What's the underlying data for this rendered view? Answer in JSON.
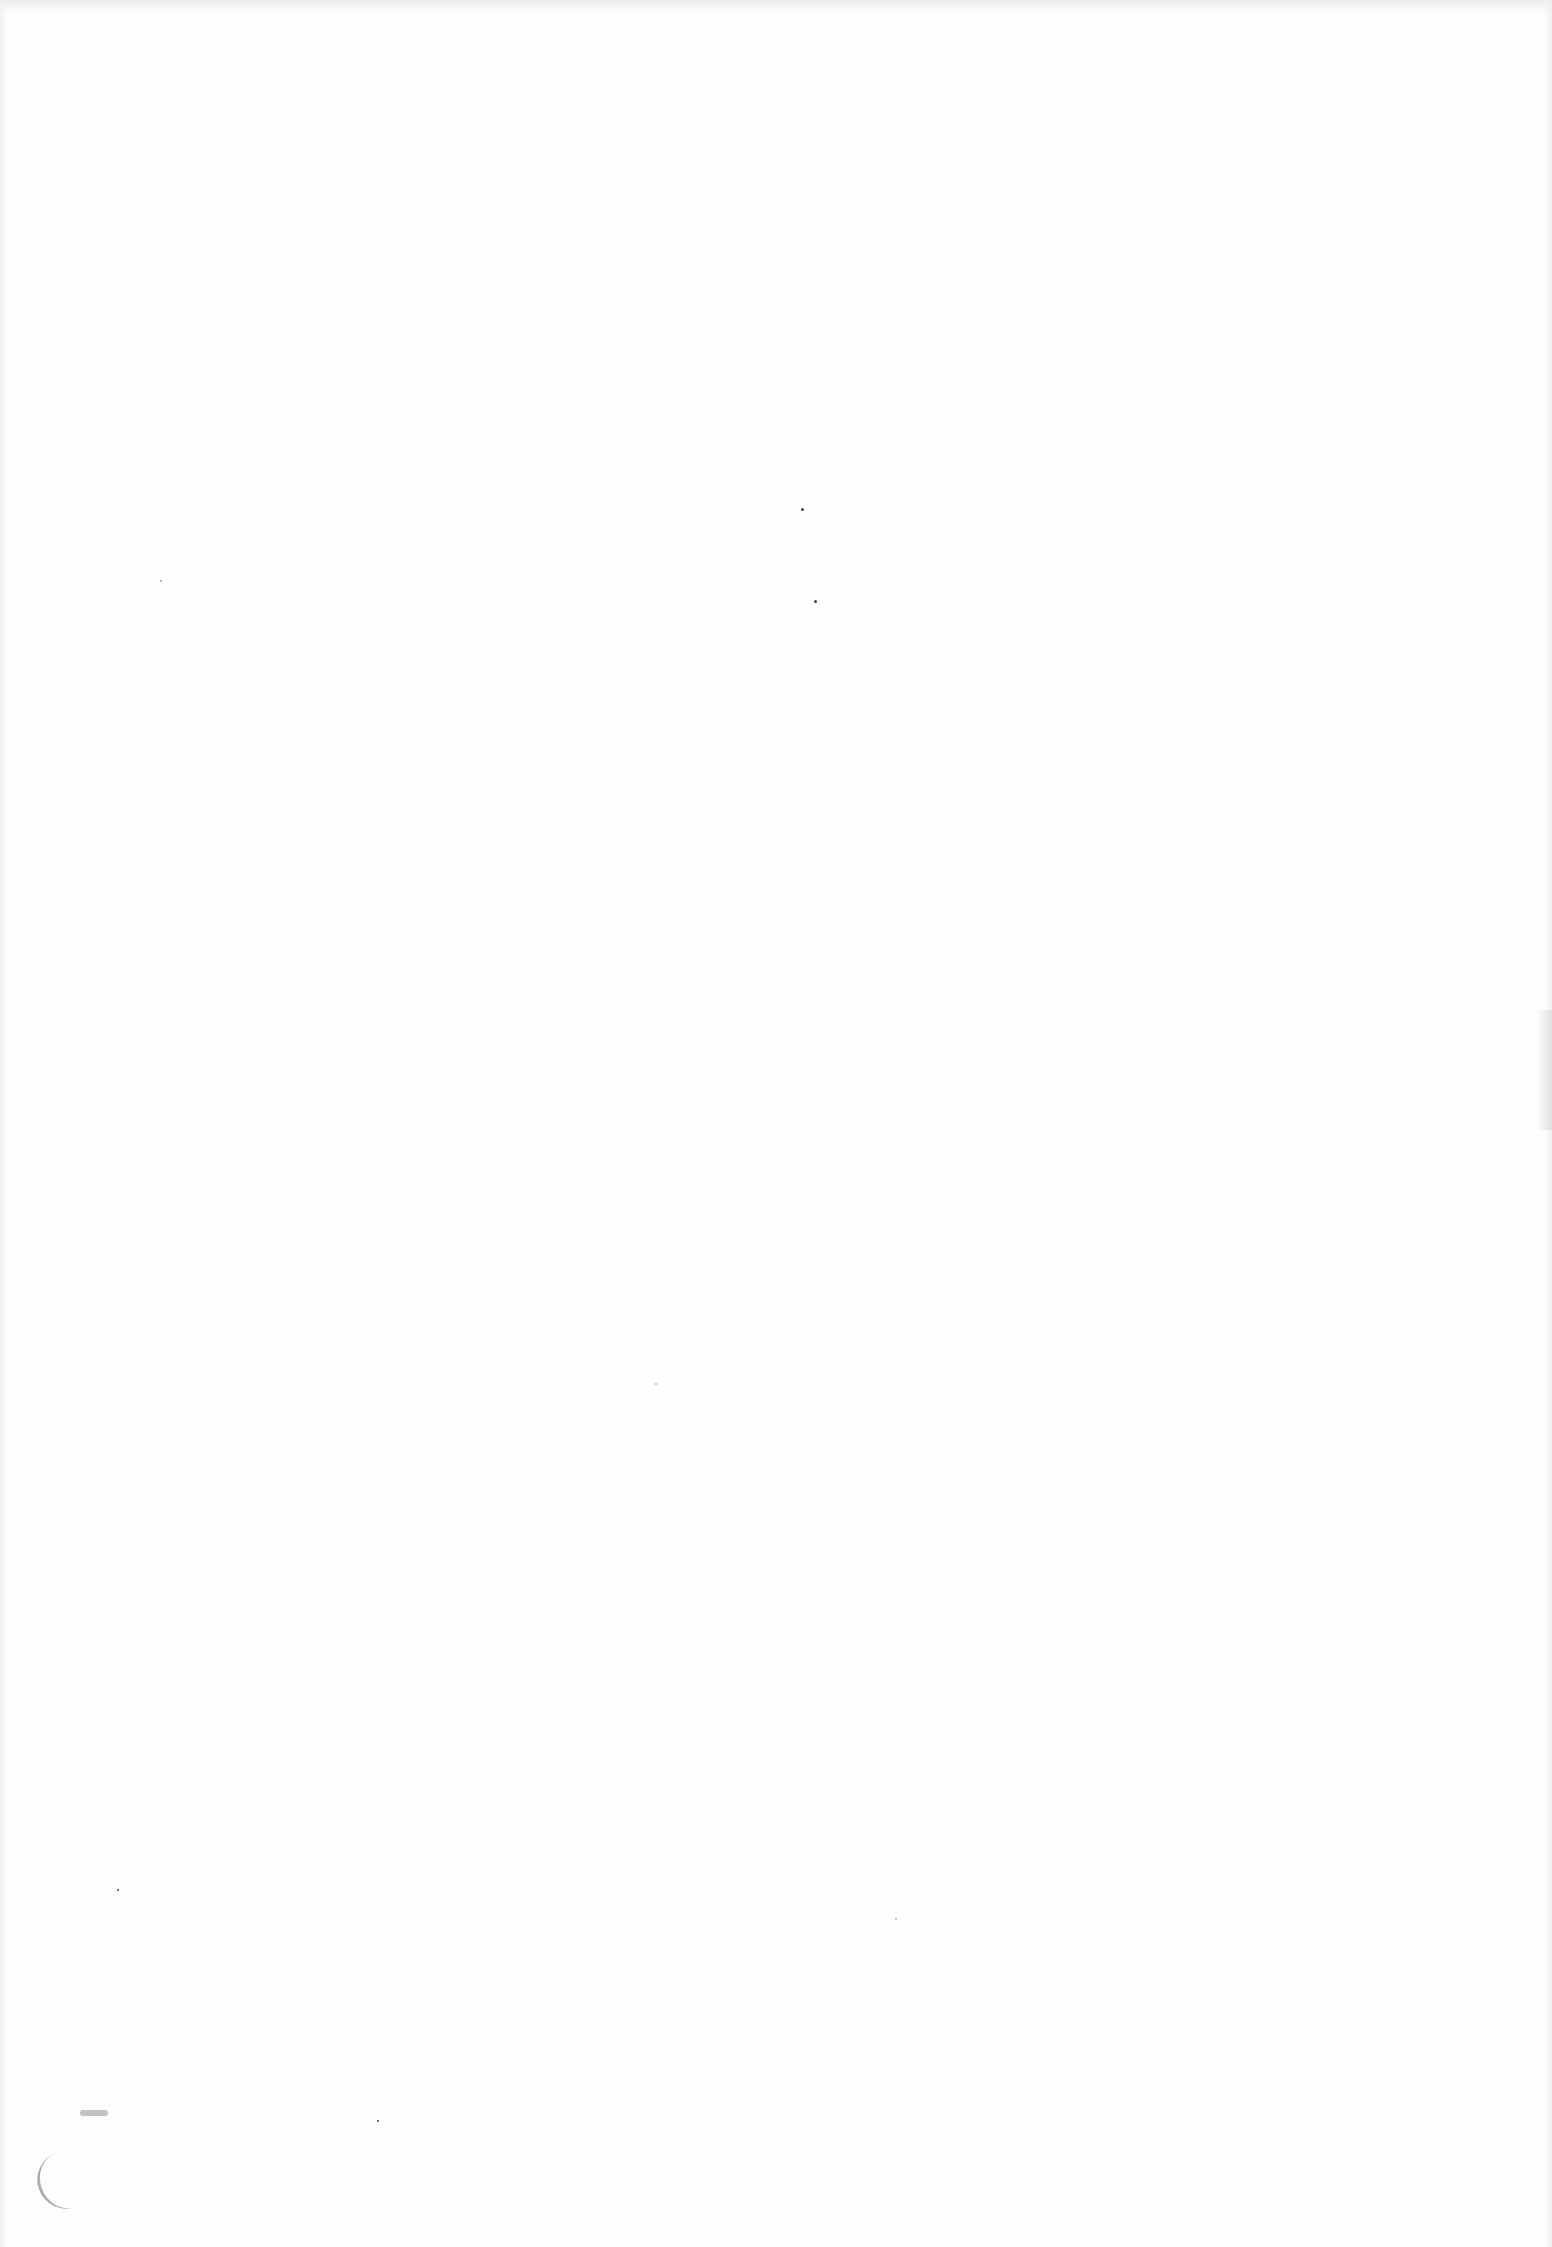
{
  "document": {
    "type": "scanned-page",
    "content": "",
    "background_color": "#fefefe",
    "marks": [
      {
        "kind": "speck",
        "x": 801,
        "y": 508
      },
      {
        "kind": "speck",
        "x": 814,
        "y": 600
      },
      {
        "kind": "speck",
        "x": 160,
        "y": 580
      },
      {
        "kind": "speck",
        "x": 117,
        "y": 1889
      },
      {
        "kind": "speck",
        "x": 377,
        "y": 2120
      },
      {
        "kind": "smudge",
        "x": 40,
        "y": 2160
      }
    ]
  }
}
